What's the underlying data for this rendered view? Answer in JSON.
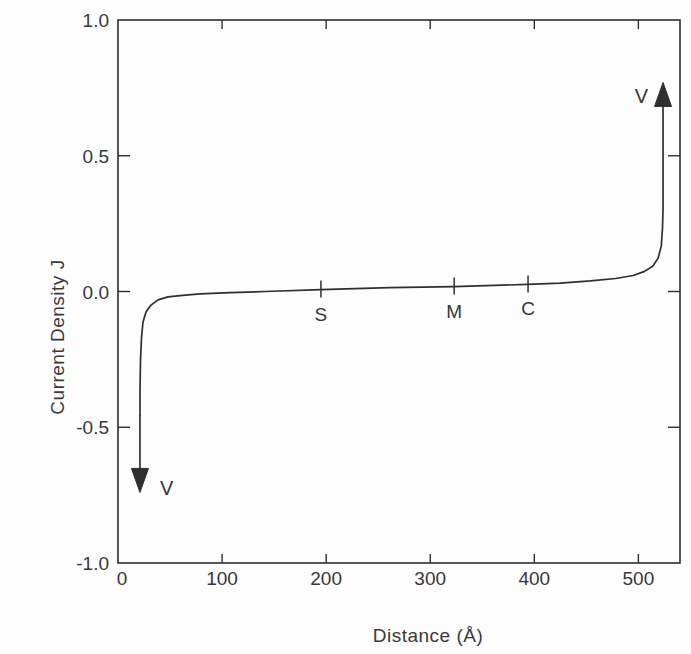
{
  "figure": {
    "background": "#fdfdfd",
    "line_color": "#2f2f2f",
    "text_color": "#383838"
  },
  "chart_data": {
    "type": "line",
    "title": "",
    "xlabel": "Distance (Å)",
    "ylabel": "Current Density J",
    "xlim": [
      0,
      540
    ],
    "ylim": [
      -1.0,
      1.0
    ],
    "grid": false,
    "legend": null,
    "x_ticks": [
      {
        "value": 0,
        "label": "0"
      },
      {
        "value": 100,
        "label": "100"
      },
      {
        "value": 200,
        "label": "200"
      },
      {
        "value": 300,
        "label": "300"
      },
      {
        "value": 400,
        "label": "400"
      },
      {
        "value": 500,
        "label": "500"
      }
    ],
    "y_ticks": [
      {
        "value": -1.0,
        "label": "-1.0"
      },
      {
        "value": -0.5,
        "label": "-0.5"
      },
      {
        "value": 0.0,
        "label": "0.0"
      },
      {
        "value": 0.5,
        "label": "0.5"
      },
      {
        "value": 1.0,
        "label": "1.0"
      }
    ],
    "series": [
      {
        "name": "current-density-vs-distance",
        "points": [
          [
            21.1,
            -0.455
          ],
          [
            21.1,
            -0.363
          ],
          [
            21.6,
            -0.252
          ],
          [
            22.6,
            -0.171
          ],
          [
            24.0,
            -0.112
          ],
          [
            26.9,
            -0.076
          ],
          [
            31.7,
            -0.05
          ],
          [
            38.4,
            -0.031
          ],
          [
            48.0,
            -0.02
          ],
          [
            59.6,
            -0.015
          ],
          [
            78.8,
            -0.009
          ],
          [
            107.6,
            -0.004
          ],
          [
            141.3,
            0.0
          ],
          [
            195.0,
            0.007
          ],
          [
            261.0,
            0.014
          ],
          [
            323.0,
            0.018
          ],
          [
            394.0,
            0.026
          ],
          [
            425.0,
            0.031
          ],
          [
            454.0,
            0.039
          ],
          [
            478.0,
            0.048
          ],
          [
            495.0,
            0.059
          ],
          [
            506.0,
            0.074
          ],
          [
            514.0,
            0.094
          ],
          [
            519.0,
            0.123
          ],
          [
            522.0,
            0.168
          ],
          [
            523.2,
            0.234
          ],
          [
            523.7,
            0.3
          ]
        ]
      }
    ],
    "region_markers": [
      {
        "label": "S",
        "x": 195
      },
      {
        "label": "M",
        "x": 323
      },
      {
        "label": "C",
        "x": 394
      }
    ],
    "divergence_arrows": [
      {
        "label": "V",
        "x": 21.1,
        "from_j": -0.455,
        "tip_j": -0.74,
        "direction": "down"
      },
      {
        "label": "V",
        "x": 523.7,
        "from_j": 0.3,
        "tip_j": 0.77,
        "direction": "up"
      }
    ]
  }
}
